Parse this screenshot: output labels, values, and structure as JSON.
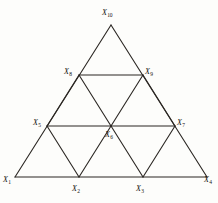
{
  "figure": {
    "background_color": "#fdfdfb",
    "stroke_color": "#2b2723",
    "label_color": "#15120f",
    "stroke_width": 1,
    "canvas": {
      "width": 218,
      "height": 203
    }
  },
  "geometry": {
    "apex": {
      "x": 111,
      "y": 25
    },
    "base_left": {
      "x": 15,
      "y": 177
    },
    "base_right": {
      "x": 207,
      "y": 177
    },
    "rows": 4,
    "row_y": [
      25,
      75,
      126,
      177
    ],
    "description": "Equilateral triangle subdivided into 9 small triangles by 3 rows of lattice points"
  },
  "vertices": [
    {
      "id": "X1",
      "base": "X",
      "subscript": "1",
      "x": 15,
      "y": 177,
      "label_x": 2,
      "label_y": 176,
      "row": 3,
      "col": 0
    },
    {
      "id": "X2",
      "base": "X",
      "subscript": "2",
      "x": 79,
      "y": 177,
      "label_x": 71,
      "label_y": 185,
      "row": 3,
      "col": 1
    },
    {
      "id": "X3",
      "base": "X",
      "subscript": "3",
      "x": 143,
      "y": 177,
      "label_x": 135,
      "label_y": 185,
      "row": 3,
      "col": 2
    },
    {
      "id": "X4",
      "base": "X",
      "subscript": "4",
      "x": 207,
      "y": 177,
      "label_x": 203,
      "label_y": 176,
      "row": 3,
      "col": 3
    },
    {
      "id": "X5",
      "base": "X",
      "subscript": "5",
      "x": 47,
      "y": 126,
      "label_x": 33,
      "label_y": 119,
      "row": 2,
      "col": 0
    },
    {
      "id": "X6",
      "base": "X",
      "subscript": "6",
      "x": 111,
      "y": 126,
      "label_x": 104,
      "label_y": 131,
      "row": 2,
      "col": 1
    },
    {
      "id": "X7",
      "base": "X",
      "subscript": "7",
      "x": 175,
      "y": 126,
      "label_x": 176,
      "label_y": 119,
      "row": 2,
      "col": 2
    },
    {
      "id": "X8",
      "base": "X",
      "subscript": "8",
      "x": 79,
      "y": 75,
      "label_x": 64,
      "label_y": 68,
      "row": 1,
      "col": 0
    },
    {
      "id": "X9",
      "base": "X",
      "subscript": "9",
      "x": 143,
      "y": 75,
      "label_x": 144,
      "label_y": 68,
      "row": 1,
      "col": 1
    },
    {
      "id": "X10",
      "base": "X",
      "subscript": "10",
      "x": 111,
      "y": 25,
      "label_x": 102,
      "label_y": 9,
      "row": 0,
      "col": 0
    }
  ],
  "edges": [
    {
      "from": "X1",
      "to": "X4",
      "kind": "horizontal",
      "role": "base-line"
    },
    {
      "from": "X5",
      "to": "X7",
      "kind": "horizontal",
      "role": "middle-line"
    },
    {
      "from": "X8",
      "to": "X9",
      "kind": "horizontal",
      "role": "upper-line"
    },
    {
      "from": "X1",
      "to": "X10",
      "kind": "left-side",
      "role": "outer-left"
    },
    {
      "from": "X4",
      "to": "X10",
      "kind": "right-side",
      "role": "outer-right"
    },
    {
      "from": "X2",
      "to": "X8",
      "kind": "left-diagonal",
      "role": "inner"
    },
    {
      "from": "X3",
      "to": "X9",
      "kind": "left-diagonal",
      "role": "inner"
    },
    {
      "from": "X2",
      "to": "X5",
      "kind": "right-diagonal",
      "role": "inner"
    },
    {
      "from": "X3",
      "to": "X7",
      "kind": "right-diagonal",
      "role": "inner"
    },
    {
      "from": "X5",
      "to": "X2",
      "kind": "down-right",
      "role": "inner"
    },
    {
      "from": "X6",
      "to": "X3",
      "kind": "down-right",
      "role": "inner"
    }
  ],
  "labels": {
    "X1": "X",
    "X2": "X",
    "X3": "X",
    "X4": "X",
    "X5": "X",
    "X6": "X",
    "X7": "X",
    "X8": "X",
    "X9": "X",
    "X10": "X",
    "sub_X1": "1",
    "sub_X2": "2",
    "sub_X3": "3",
    "sub_X4": "4",
    "sub_X5": "5",
    "sub_X6": "6",
    "sub_X7": "7",
    "sub_X8": "8",
    "sub_X9": "9",
    "sub_X10": "10"
  }
}
